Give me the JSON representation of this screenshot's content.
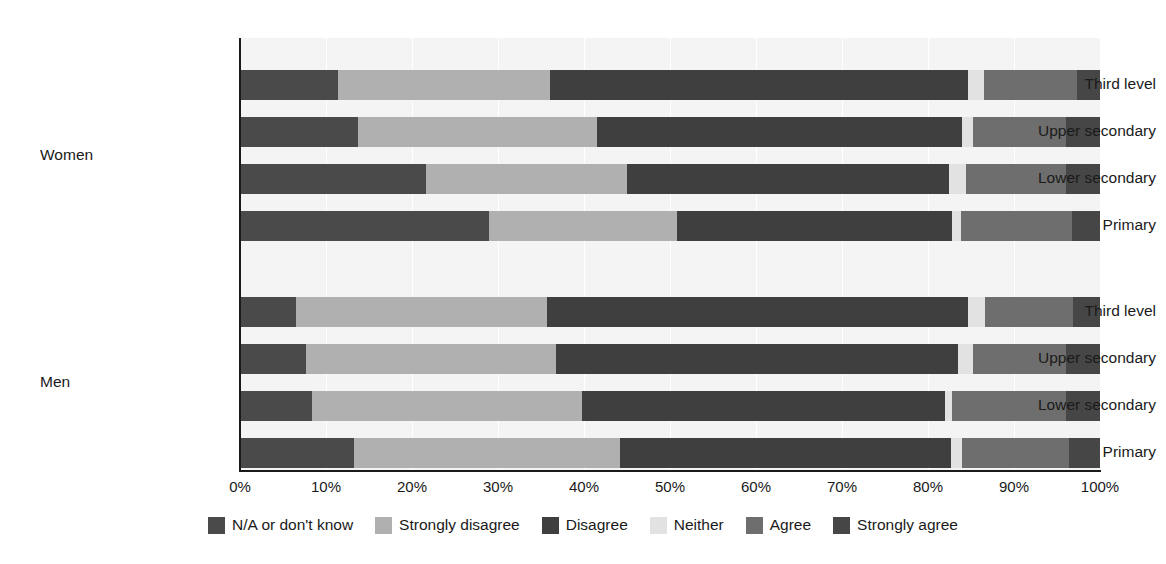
{
  "chart_data": {
    "type": "bar",
    "subtype": "stacked-horizontal-100pct",
    "title": "",
    "xlabel": "",
    "ylabel": "",
    "grid": true,
    "legend_position": "bottom",
    "xlim": [
      0,
      100
    ],
    "xticks": [
      "0%",
      "10%",
      "20%",
      "30%",
      "40%",
      "50%",
      "60%",
      "70%",
      "80%",
      "90%",
      "100%"
    ],
    "xtick_values": [
      0,
      10,
      20,
      30,
      40,
      50,
      60,
      70,
      80,
      90,
      100
    ],
    "groups": [
      "Women",
      "Men"
    ],
    "categories": [
      "Third level",
      "Upper secondary",
      "Lower secondary",
      "Primary"
    ],
    "series": [
      {
        "name": "N/A or don't know",
        "color": "#4a4a4a"
      },
      {
        "name": "Strongly disagree",
        "color": "#b0b0b0"
      },
      {
        "name": "Disagree",
        "color": "#3f3f3f"
      },
      {
        "name": "Neither",
        "color": "#e2e2e2"
      },
      {
        "name": "Agree",
        "color": "#6e6e6e"
      },
      {
        "name": "Strongly agree",
        "color": "#464646"
      }
    ],
    "rows": [
      {
        "group": "Women",
        "category": "Third level",
        "values": [
          11.4,
          24.6,
          48.6,
          1.9,
          10.8,
          2.7
        ]
      },
      {
        "group": "Women",
        "category": "Upper secondary",
        "values": [
          13.7,
          27.8,
          42.5,
          1.2,
          10.8,
          4.0
        ]
      },
      {
        "group": "Women",
        "category": "Lower secondary",
        "values": [
          21.6,
          23.4,
          37.4,
          2.0,
          11.6,
          4.0
        ]
      },
      {
        "group": "Women",
        "category": "Primary",
        "values": [
          29.0,
          21.8,
          32.0,
          1.0,
          13.0,
          3.2
        ]
      },
      {
        "group": "Men",
        "category": "Third level",
        "values": [
          6.5,
          29.2,
          48.9,
          2.0,
          10.3,
          3.1
        ]
      },
      {
        "group": "Men",
        "category": "Upper secondary",
        "values": [
          7.7,
          29.1,
          46.7,
          1.7,
          10.8,
          4.0
        ]
      },
      {
        "group": "Men",
        "category": "Lower secondary",
        "values": [
          8.4,
          31.4,
          42.2,
          0.8,
          13.2,
          4.0
        ]
      },
      {
        "group": "Men",
        "category": "Primary",
        "values": [
          13.2,
          31.0,
          38.5,
          1.3,
          12.4,
          3.6
        ]
      }
    ]
  },
  "legend": {
    "items": [
      {
        "label": "N/A or don't know",
        "color": "#4a4a4a"
      },
      {
        "label": "Strongly disagree",
        "color": "#b0b0b0"
      },
      {
        "label": "Disagree",
        "color": "#3f3f3f"
      },
      {
        "label": "Neither",
        "color": "#e2e2e2"
      },
      {
        "label": "Agree",
        "color": "#6e6e6e"
      },
      {
        "label": "Strongly agree",
        "color": "#464646"
      }
    ]
  },
  "colors": {
    "plot_background": "#f4f4f4",
    "page_background": "#ffffff",
    "axis": "#1a1a1a",
    "gridline": "#ffffff",
    "text": "#1a1a1a"
  }
}
